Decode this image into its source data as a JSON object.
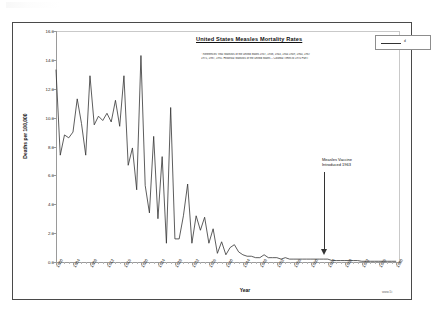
{
  "document": {
    "title": "United States Measles Mortality Rates",
    "watermark": "www.5i"
  },
  "legend": {
    "label": "d",
    "swatch_color": "#333333"
  },
  "annotation": {
    "line1": "Measles Vaccine",
    "line2": "Introduced 1963",
    "arrow_year": 1963
  },
  "references": {
    "line1": "* References:  Vital Statistics of the United States 1937, 1938, 1943, 1944 1949,  1960, 1967",
    "line2": "1975, 1987, 1992. Historical Statistics of the United States -- Colonial Times to 1970 Part I"
  },
  "chart_data": {
    "type": "line",
    "title": "United States Measles Mortality Rates",
    "subtitle": "",
    "xlabel": "Year",
    "ylabel": "Deaths per 100,000",
    "xlim": [
      1900,
      1981
    ],
    "ylim": [
      0.0,
      16.0
    ],
    "grid": false,
    "legend_position": "top-right",
    "ytick_labels": [
      "0.0",
      "2.0",
      "4.0",
      "6.0",
      "8.0",
      "10.0",
      "12.0",
      "14.0",
      "16.0"
    ],
    "ytick_values": [
      0,
      2,
      4,
      6,
      8,
      10,
      12,
      14,
      16
    ],
    "xtick_labels": [
      "1900",
      "1904",
      "1908",
      "1912",
      "1916",
      "1920",
      "1924",
      "1928",
      "1932",
      "1936",
      "1940",
      "1944",
      "1948",
      "1952",
      "1956",
      "1960",
      "1964",
      "1968",
      "1972",
      "1976",
      "1980"
    ],
    "xtick_values": [
      1900,
      1904,
      1908,
      1912,
      1916,
      1920,
      1924,
      1928,
      1932,
      1936,
      1940,
      1944,
      1948,
      1952,
      1956,
      1960,
      1964,
      1968,
      1972,
      1976,
      1980
    ],
    "series": [
      {
        "name": "Measles mortality rate",
        "color": "#333333",
        "x": [
          1900,
          1901,
          1902,
          1903,
          1904,
          1905,
          1906,
          1907,
          1908,
          1909,
          1910,
          1911,
          1912,
          1913,
          1914,
          1915,
          1916,
          1917,
          1918,
          1919,
          1920,
          1921,
          1922,
          1923,
          1924,
          1925,
          1926,
          1927,
          1928,
          1929,
          1930,
          1931,
          1932,
          1933,
          1934,
          1935,
          1936,
          1937,
          1938,
          1939,
          1940,
          1941,
          1942,
          1943,
          1944,
          1945,
          1946,
          1947,
          1948,
          1949,
          1950,
          1951,
          1952,
          1953,
          1954,
          1955,
          1956,
          1957,
          1958,
          1959,
          1960,
          1961,
          1962,
          1963,
          1964,
          1965,
          1966,
          1967,
          1968,
          1969,
          1970,
          1971,
          1972,
          1973,
          1974,
          1975,
          1976,
          1977,
          1978,
          1979,
          1980
        ],
        "values": [
          13.3,
          7.4,
          8.8,
          8.6,
          9.0,
          11.3,
          9.6,
          7.4,
          12.9,
          9.5,
          10.1,
          9.8,
          10.3,
          9.7,
          11.2,
          9.4,
          12.9,
          6.7,
          7.9,
          5.0,
          14.3,
          5.3,
          3.4,
          8.7,
          3.0,
          7.3,
          1.3,
          10.7,
          1.6,
          1.6,
          3.2,
          5.4,
          1.3,
          3.2,
          2.2,
          3.1,
          1.3,
          2.3,
          0.6,
          1.4,
          0.5,
          1.0,
          1.2,
          0.7,
          0.5,
          0.4,
          0.4,
          0.3,
          0.3,
          0.5,
          0.3,
          0.3,
          0.3,
          0.2,
          0.3,
          0.2,
          0.2,
          0.2,
          0.2,
          0.2,
          0.2,
          0.2,
          0.2,
          0.2,
          0.2,
          0.1,
          0.1,
          0.1,
          0.1,
          0.1,
          0.1,
          0.1,
          0.05,
          0.05,
          0.05,
          0.05,
          0.05,
          0.05,
          0.05,
          0.05,
          0.05
        ]
      }
    ]
  }
}
